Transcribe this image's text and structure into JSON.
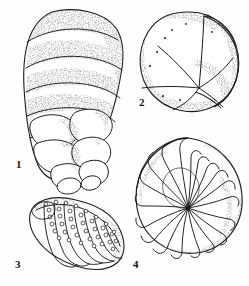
{
  "plate": {
    "title": "Foraminifera specimens plate",
    "subject": "foraminifera",
    "background_color": "#fefefe",
    "ink_color": "#1a1a1a",
    "stipple_color": "#3a3a3a",
    "width": 249,
    "height": 286,
    "style": "pen-and-ink stipple scientific illustration",
    "figure_count": 4
  },
  "figures": [
    {
      "number": "1",
      "label": "1",
      "name": "elongate-trochospiral-test",
      "description": "Tall tapering test with broad obliquely-banded early chambers and rounded lobate later chambers arranged in a descending spiral; coarse stippled shading",
      "chamber_count": 12,
      "outline_color": "#1a1a1a",
      "position": {
        "x": 18,
        "y": 10,
        "width": 110,
        "height": 175
      },
      "label_position": {
        "x": 16,
        "y": 159
      }
    },
    {
      "number": "2",
      "label": "2",
      "name": "globular-trochospiral-test",
      "description": "Rounded subglobular test in apertural view with five to six chambers converging at a central point and an inflated final chamber on the right",
      "chamber_count": 6,
      "outline_color": "#1a1a1a",
      "position": {
        "x": 140,
        "y": 12,
        "width": 100,
        "height": 100
      },
      "label_position": {
        "x": 139,
        "y": 97
      }
    },
    {
      "number": "3",
      "label": "3",
      "name": "elongate-beaded-test",
      "description": "Curved elongate test with arched loop-shaped chamber outlines and rows of beads or nodes along the sutures",
      "chamber_count": 10,
      "outline_color": "#1a1a1a",
      "position": {
        "x": 22,
        "y": 196,
        "width": 105,
        "height": 75
      },
      "label_position": {
        "x": 15,
        "y": 259
      }
    },
    {
      "number": "4",
      "label": "4",
      "name": "planispiral-involute-test",
      "description": "Nautiloid planispiral involute test with about twenty curved septal lines radiating from a small central umbilicus",
      "chamber_count": 20,
      "outline_color": "#1a1a1a",
      "position": {
        "x": 134,
        "y": 137,
        "width": 108,
        "height": 117
      },
      "label_position": {
        "x": 133,
        "y": 259
      },
      "umbilicus": {
        "x": 188,
        "y": 208
      }
    }
  ]
}
